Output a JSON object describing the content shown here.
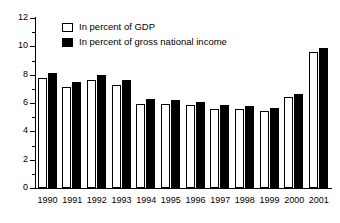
{
  "chart_data": {
    "type": "bar",
    "title": "",
    "xlabel": "",
    "ylabel": "",
    "ylim": [
      0,
      12
    ],
    "ytick_step": 2,
    "yticks": [
      "0",
      "2",
      "4",
      "6",
      "8",
      "10",
      "12"
    ],
    "minor_ticks": [
      1,
      3,
      5,
      7,
      9,
      11
    ],
    "grid": false,
    "legend_position": "top-left",
    "categories": [
      "1990",
      "1991",
      "1992",
      "1993",
      "1994",
      "1995",
      "1996",
      "1997",
      "1998",
      "1999",
      "2000",
      "2001"
    ],
    "series": [
      {
        "name": "In percent of GDP",
        "color": "#ffffff",
        "edge_color": "#000000",
        "values": [
          7.8,
          7.15,
          7.6,
          7.25,
          5.95,
          5.9,
          5.85,
          5.6,
          5.55,
          5.45,
          6.4,
          9.6
        ]
      },
      {
        "name": "In percent of gross national income",
        "color": "#000000",
        "edge_color": "#000000",
        "values": [
          8.1,
          7.5,
          7.95,
          7.65,
          6.25,
          6.2,
          6.1,
          5.85,
          5.8,
          5.65,
          6.65,
          9.9
        ]
      }
    ]
  },
  "legend": {
    "items": [
      {
        "label": "In percent of GDP",
        "swatch": "gdp"
      },
      {
        "label": "In percent of gross national income",
        "swatch": "gni"
      }
    ]
  },
  "colors": {
    "axis": "#000000",
    "background": "#ffffff",
    "series_gdp": "#ffffff",
    "series_gni": "#000000"
  }
}
